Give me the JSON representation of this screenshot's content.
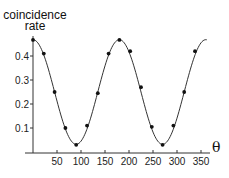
{
  "chart_data": {
    "type": "line",
    "title": "",
    "xlabel": "θ",
    "ylabel": "coincidence rate",
    "ylabel_lines": [
      "coincidence",
      "rate"
    ],
    "xlim": [
      0,
      360
    ],
    "ylim": [
      0,
      0.5
    ],
    "xticks": [
      50,
      100,
      150,
      200,
      250,
      300,
      350
    ],
    "yticks": [
      0.1,
      0.2,
      0.3,
      0.4
    ],
    "grid": false,
    "legend": null,
    "series": [
      {
        "name": "measured",
        "style": "points",
        "x": [
          0,
          22.5,
          45,
          67.5,
          90,
          112.5,
          135,
          157.5,
          180,
          202.5,
          225,
          247.5,
          270,
          292.5,
          315,
          337.5
        ],
        "y": [
          0.467,
          0.41,
          0.25,
          0.1,
          0.03,
          0.11,
          0.245,
          0.41,
          0.467,
          0.42,
          0.27,
          0.105,
          0.03,
          0.11,
          0.25,
          0.42
        ]
      },
      {
        "name": "fit",
        "style": "line",
        "model": "a + b*cos(2θ)",
        "a": 0.25,
        "b": 0.218
      }
    ]
  }
}
